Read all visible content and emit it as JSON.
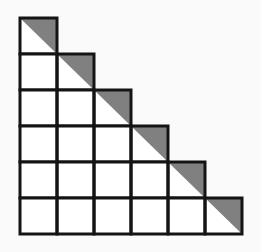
{
  "figure": {
    "background_color": "#fafafa",
    "cell_fill_color": "#ffffff",
    "shaded_triangle_color": "#808080",
    "stroke_color": "#141414",
    "stroke_width": 3,
    "origin_x": 20,
    "origin_y": 18,
    "cell_width": 37,
    "cell_height": 36,
    "row_count": 6,
    "column_count": 6,
    "shape_description": "lower-left staircase triangle of unit squares",
    "rows": [
      {
        "index": 1,
        "cell_count": 1,
        "diagonal_cell_column": 1,
        "shaded_triangle_orientation": "upper-right"
      },
      {
        "index": 2,
        "cell_count": 2,
        "diagonal_cell_column": 2,
        "shaded_triangle_orientation": "upper-right"
      },
      {
        "index": 3,
        "cell_count": 3,
        "diagonal_cell_column": 3,
        "shaded_triangle_orientation": "upper-right"
      },
      {
        "index": 4,
        "cell_count": 4,
        "diagonal_cell_column": 4,
        "shaded_triangle_orientation": "upper-right"
      },
      {
        "index": 5,
        "cell_count": 5,
        "diagonal_cell_column": 5,
        "shaded_triangle_orientation": "upper-right"
      },
      {
        "index": 6,
        "cell_count": 6,
        "diagonal_cell_column": 6,
        "shaded_triangle_orientation": "upper-right"
      }
    ]
  }
}
